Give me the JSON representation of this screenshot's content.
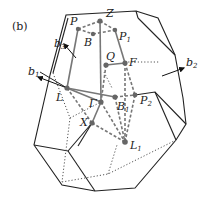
{
  "panel_label": "(b)",
  "colors": {
    "outline": "#222222",
    "path": "#777777",
    "dotted": "#555555",
    "point": "#666666",
    "background": "#ffffff"
  },
  "vectors": [
    {
      "name": "b1",
      "label": "b",
      "sub": "1"
    },
    {
      "name": "b2",
      "label": "b",
      "sub": "2"
    },
    {
      "name": "b3",
      "label": "b",
      "sub": "3"
    }
  ],
  "points": [
    {
      "name": "P",
      "label": "P",
      "sub": ""
    },
    {
      "name": "B",
      "label": "B",
      "sub": ""
    },
    {
      "name": "Z",
      "label": "Z",
      "sub": ""
    },
    {
      "name": "P1",
      "label": "P",
      "sub": "1"
    },
    {
      "name": "Q",
      "label": "Q",
      "sub": ""
    },
    {
      "name": "F",
      "label": "F",
      "sub": ""
    },
    {
      "name": "L",
      "label": "L",
      "sub": ""
    },
    {
      "name": "Gamma",
      "label": "Γ",
      "sub": ""
    },
    {
      "name": "B1",
      "label": "B",
      "sub": "1"
    },
    {
      "name": "P2",
      "label": "P",
      "sub": "2"
    },
    {
      "name": "X",
      "label": "X",
      "sub": ""
    },
    {
      "name": "L1",
      "label": "L",
      "sub": "1"
    }
  ]
}
